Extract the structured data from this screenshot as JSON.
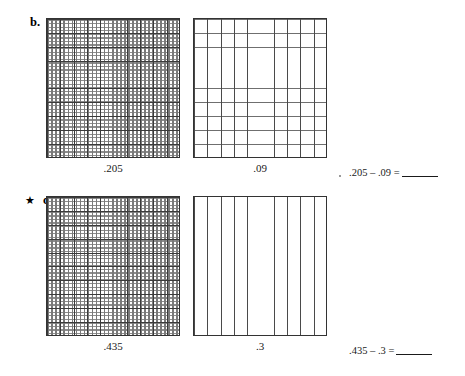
{
  "worksheet": {
    "title": "Decimal subtraction with hundredths grids",
    "ink_color": "#333333",
    "paper_color": "#ffffff"
  },
  "problems": [
    {
      "id": "b",
      "star": "",
      "letter": "b.",
      "has_star": false,
      "grids": [
        {
          "name": "grid-205",
          "kind": "fine-hundredths",
          "caption": ".205",
          "value": 0.205,
          "columns": 100,
          "rows": 100,
          "major_divisions": 10
        },
        {
          "name": "grid-09",
          "kind": "tenths-square",
          "caption": ".09",
          "value": 0.09,
          "columns": 10,
          "rows": 10,
          "major_divisions": 10
        }
      ],
      "equation": {
        "minuend": ".205",
        "operator": "–",
        "subtrahend": ".09",
        "equals": "=",
        "answer": "",
        "full_text": ".205 – .09 ="
      }
    },
    {
      "id": "c",
      "star": "★",
      "letter": "c.",
      "has_star": true,
      "grids": [
        {
          "name": "grid-435",
          "kind": "fine-hundredths",
          "caption": ".435",
          "value": 0.435,
          "columns": 100,
          "rows": 100,
          "major_divisions": 10
        },
        {
          "name": "grid-3",
          "kind": "tenths-columns",
          "caption": ".3",
          "value": 0.3,
          "columns": 10,
          "rows": 1,
          "major_divisions": 10
        }
      ],
      "equation": {
        "minuend": ".435",
        "operator": "–",
        "subtrahend": ".3",
        "equals": "=",
        "answer": "",
        "full_text": ".435 – .3 ="
      }
    }
  ]
}
